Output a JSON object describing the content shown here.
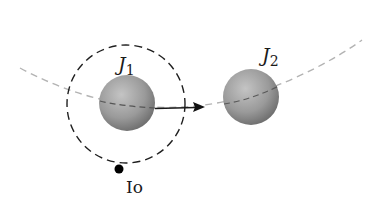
{
  "diagram": {
    "labels": {
      "j1_main": "J",
      "j1_sub": "1",
      "j2_main": "J",
      "j2_sub": "2",
      "io": "Io"
    },
    "colors": {
      "background": "#ffffff",
      "sphere_light": "#b5b5b5",
      "sphere_dark": "#6f6f6f",
      "orbit_path": "#b0b0b0",
      "io_orbit": "#1a1a1a",
      "arrow": "#1a1a1a",
      "io_dot": "#000000"
    }
  }
}
